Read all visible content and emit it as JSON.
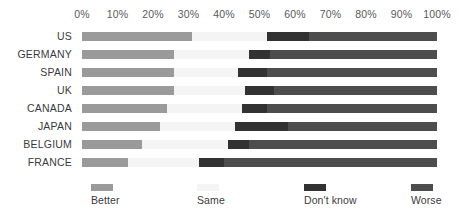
{
  "chart_data": {
    "type": "bar",
    "orientation": "horizontal",
    "stacked": true,
    "stacked_percent": true,
    "title": "",
    "subtitle": "",
    "xlabel": "",
    "ylabel": "",
    "xlim": [
      0,
      100
    ],
    "grid": false,
    "legend_position": "bottom",
    "axis_ticks": [
      "0%",
      "10%",
      "20%",
      "30%",
      "40%",
      "50%",
      "60%",
      "70%",
      "80%",
      "90%",
      "100%"
    ],
    "axis_tick_values": [
      0,
      10,
      20,
      30,
      40,
      50,
      60,
      70,
      80,
      90,
      100
    ],
    "categories": [
      "US",
      "GERMANY",
      "SPAIN",
      "UK",
      "CANADA",
      "JAPAN",
      "BELGIUM",
      "FRANCE"
    ],
    "series": [
      {
        "name": "Better",
        "color": "#9a9a9a",
        "values": [
          31,
          26,
          26,
          26,
          24,
          22,
          17,
          13
        ]
      },
      {
        "name": "Same",
        "color": "#f4f4f4",
        "values": [
          21,
          21,
          18,
          20,
          21,
          21,
          24,
          20
        ]
      },
      {
        "name": "Don't know",
        "color": "#323232",
        "values": [
          12,
          6,
          8,
          8,
          7,
          15,
          6,
          7
        ]
      },
      {
        "name": "Worse",
        "color": "#4d4d4d",
        "values": [
          36,
          47,
          48,
          46,
          48,
          42,
          53,
          60
        ]
      }
    ]
  },
  "legend": {
    "items": [
      {
        "label": "Better",
        "color": "#9a9a9a",
        "left_px": 9
      },
      {
        "label": "Same",
        "color": "#f4f4f4",
        "left_px": 115
      },
      {
        "label": "Don't know",
        "color": "#323232",
        "left_px": 222
      },
      {
        "label": "Worse",
        "color": "#4d4d4d",
        "left_px": 329
      }
    ]
  }
}
